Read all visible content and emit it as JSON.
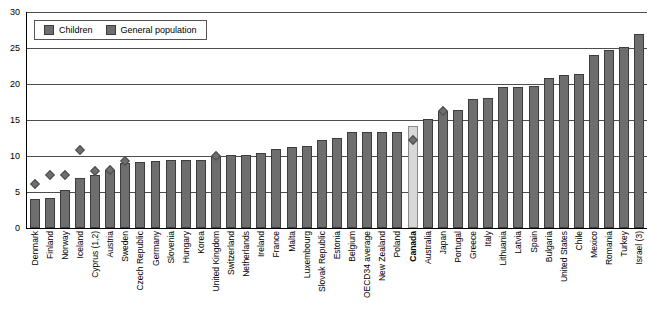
{
  "legend": {
    "position": "top-left",
    "entries": [
      {
        "label": "Children",
        "icon": "diamond-marker",
        "color": "#6e6e6e"
      },
      {
        "label": "General population",
        "icon": "bar-swatch",
        "color": "#6e6e6e"
      }
    ]
  },
  "colors": {
    "bar": "#6e6e6e",
    "bar_border": "#3d3d3d",
    "highlight_bar": "#d8d8d8",
    "highlight_border": "#8a8a8a",
    "grid": "#4d4d4d",
    "axis": "#000000"
  },
  "highlight": {
    "category": "Canada",
    "style": "bold-label-light-bar"
  },
  "chart_data": {
    "type": "bar",
    "title": "",
    "xlabel": "",
    "ylabel": "",
    "ylim": [
      0,
      30
    ],
    "yticks": [
      0,
      5,
      10,
      15,
      20,
      25,
      30
    ],
    "ytick_labels": [
      "0",
      "5",
      "10",
      "15",
      "20",
      "25",
      "30"
    ],
    "grid": true,
    "legend_position": "top-left",
    "categories": [
      "Denmark",
      "Finland",
      "Norway",
      "Iceland",
      "Cyprus (1,2)",
      "Austria",
      "Sweden",
      "Czech Republic",
      "Germany",
      "Slovenia",
      "Hungary",
      "Korea",
      "United Kingdom",
      "Switzerland",
      "Netherlands",
      "Ireland",
      "France",
      "Malta",
      "Luxembourg",
      "Slovak Republic",
      "Estonia",
      "Belgium",
      "OECD34 average",
      "New Zealand",
      "Poland",
      "Canada",
      "Australia",
      "Japan",
      "Portugal",
      "Greece",
      "Italy",
      "Lithuania",
      "Latvia",
      "Spain",
      "Bulgaria",
      "United States",
      "Chile",
      "Mexico",
      "Romania",
      "Turkey",
      "Israel (3)"
    ],
    "series": [
      {
        "name": "General population",
        "marker": "bar",
        "values": [
          4.0,
          4.1,
          5.3,
          7.0,
          7.3,
          8.0,
          9.0,
          9.2,
          9.3,
          9.4,
          9.4,
          9.5,
          10.0,
          10.1,
          10.1,
          10.4,
          11.0,
          11.2,
          11.4,
          12.2,
          12.5,
          13.3,
          13.3,
          13.3,
          13.4,
          14.2,
          15.1,
          16.3,
          16.4,
          17.9,
          18.0,
          19.6,
          19.6,
          19.7,
          20.8,
          21.2,
          21.4,
          24.0,
          24.7,
          25.1,
          27.0
        ]
      },
      {
        "name": "Children",
        "marker": "diamond",
        "values": [
          6.1,
          7.3,
          7.3,
          10.8,
          7.9,
          8.0,
          9.3,
          null,
          null,
          null,
          null,
          null,
          10.0,
          null,
          null,
          null,
          null,
          null,
          null,
          null,
          null,
          null,
          null,
          null,
          null,
          12.2,
          null,
          16.3,
          null,
          null,
          null,
          null,
          null,
          null,
          null,
          null,
          null,
          null,
          null,
          null,
          null
        ]
      }
    ]
  }
}
